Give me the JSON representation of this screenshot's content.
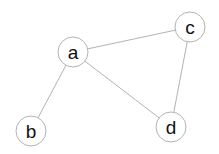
{
  "graph": {
    "nodes": [
      {
        "id": "a",
        "label": "a",
        "x": 73,
        "y": 52,
        "r": 15
      },
      {
        "id": "b",
        "label": "b",
        "x": 31,
        "y": 131,
        "r": 15
      },
      {
        "id": "c",
        "label": "c",
        "x": 190,
        "y": 27,
        "r": 15
      },
      {
        "id": "d",
        "label": "d",
        "x": 171,
        "y": 127,
        "r": 15
      }
    ],
    "edges": [
      {
        "from": "a",
        "to": "c"
      },
      {
        "from": "a",
        "to": "b"
      },
      {
        "from": "a",
        "to": "d"
      },
      {
        "from": "c",
        "to": "d"
      }
    ]
  },
  "colors": {
    "stroke": "#b3b3b3",
    "text": "#111111",
    "background": "#ffffff"
  }
}
